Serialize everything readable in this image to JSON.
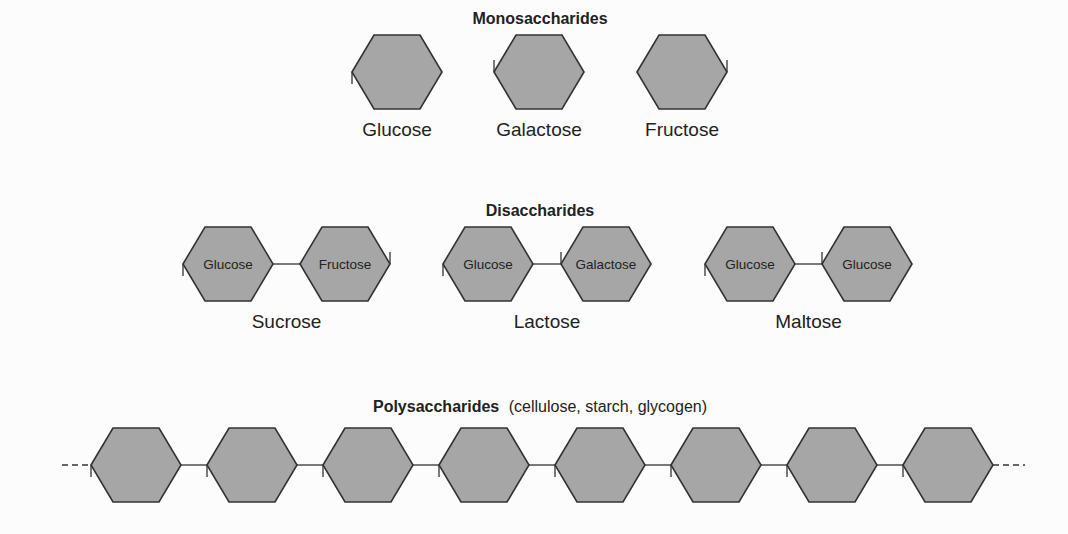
{
  "sections": {
    "monosaccharides": {
      "title": "Monosaccharides",
      "items": [
        {
          "name": "Glucose"
        },
        {
          "name": "Galactose"
        },
        {
          "name": "Fructose"
        }
      ]
    },
    "disaccharides": {
      "title": "Disaccharides",
      "items": [
        {
          "name": "Sucrose",
          "units": [
            "Glucose",
            "Fructose"
          ]
        },
        {
          "name": "Lactose",
          "units": [
            "Glucose",
            "Galactose"
          ]
        },
        {
          "name": "Maltose",
          "units": [
            "Glucose",
            "Glucose"
          ]
        }
      ]
    },
    "polysaccharides": {
      "title": "Polysaccharides",
      "subtitle": "(cellulose, starch, glycogen)",
      "unit_count": 8,
      "continues_both_ends": true
    }
  },
  "colors": {
    "hex_fill": "#a6a6a6",
    "stroke": "#333333",
    "background": "#fcfcfc"
  }
}
